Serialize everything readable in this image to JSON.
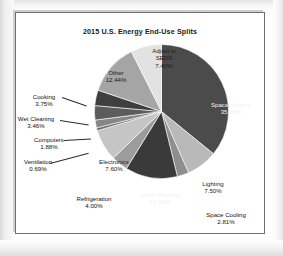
{
  "chart_data": {
    "type": "pie",
    "title": "2015 U.S. Energy End-Use Splits",
    "xlabel": "",
    "ylabel": "",
    "legend_position": "none",
    "grid": false,
    "units": "percent",
    "start_angle_deg": 0,
    "direction": "clockwise",
    "categories": [
      "Space Heating",
      "Lighting",
      "Space Cooling",
      "Water Heating",
      "Refrigeration",
      "Electronics",
      "Ventilation",
      "Computers",
      "Wet Cleaning",
      "Cooking",
      "Other",
      "Adjust to SEDS"
    ],
    "values": [
      35.88,
      7.5,
      2.81,
      12.59,
      4.0,
      7.6,
      0.69,
      1.88,
      3.46,
      3.75,
      12.44,
      7.4
    ],
    "value_labels": [
      "35.88%",
      "7.50%",
      "2.81%",
      "12.59%",
      "4.00%",
      "7.60%",
      "0.69%",
      "1.88%",
      "3.46%",
      "3.75%",
      "12.44%",
      "7.40%"
    ],
    "colors": [
      "#4b4b4b",
      "#b9b9b9",
      "#8e8e8e",
      "#3a3a3a",
      "#9c9c9c",
      "#c5c5c5",
      "#6d6d6d",
      "#868686",
      "#5c5c5c",
      "#3f3f3f",
      "#a5a5a5",
      "#e2e2e2"
    ]
  },
  "labels": {
    "space_heating": {
      "name": "Space Heating",
      "value": "35.88%"
    },
    "lighting": {
      "name": "Lighting",
      "value": "7.50%"
    },
    "space_cooling": {
      "name": "Space Cooling",
      "value": "2.81%"
    },
    "water_heating": {
      "name": "Water Heating",
      "value": "12.59%"
    },
    "refrigeration": {
      "name": "Refrigeration",
      "value": "4.00%"
    },
    "electronics": {
      "name": "Electronics",
      "value": "7.60%"
    },
    "ventilation": {
      "name": "Ventilation",
      "value": "0.69%"
    },
    "computers": {
      "name": "Computers",
      "value": "1.88%"
    },
    "wet_cleaning": {
      "name": "Wet Cleaning",
      "value": "3.46%"
    },
    "cooking": {
      "name": "Cooking",
      "value": "3.75%"
    },
    "other": {
      "name": "Other",
      "value": "12.44%"
    },
    "adjust_to_seds": {
      "name_line1": "Adjust to",
      "name_line2": "SEDS",
      "value": "7.40%"
    }
  }
}
